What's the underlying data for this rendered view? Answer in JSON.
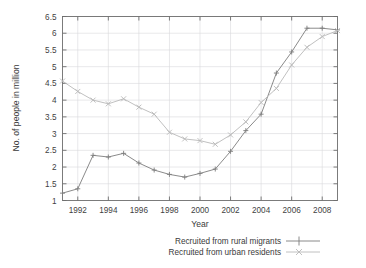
{
  "chart_data": {
    "type": "line",
    "title": "",
    "xlabel": "Year",
    "ylabel": "No. of people in million",
    "xlim": [
      1991,
      2009
    ],
    "ylim": [
      1,
      6.5
    ],
    "grid": true,
    "legend_position": "bottom",
    "x": [
      1991,
      1992,
      1993,
      1994,
      1995,
      1996,
      1997,
      1998,
      1999,
      2000,
      2001,
      2002,
      2003,
      2004,
      2005,
      2006,
      2007,
      2008,
      2009
    ],
    "xticks": [
      1992,
      1994,
      1996,
      1998,
      2000,
      2002,
      2004,
      2006,
      2008
    ],
    "xtick_labels": [
      "1992",
      "1994",
      "1996",
      "1998",
      "2000",
      "2002",
      "2004",
      "2006",
      "2008"
    ],
    "yticks": [
      1,
      1.5,
      2,
      2.5,
      3,
      3.5,
      4,
      4.5,
      5,
      5.5,
      6,
      6.5
    ],
    "ytick_labels": [
      "1",
      "1.5",
      "2",
      "2.5",
      "3",
      "3.5",
      "4",
      "4.5",
      "5",
      "5.5",
      "6",
      "6.5"
    ],
    "series": [
      {
        "name": "Recruited from rural migrants",
        "marker": "plus",
        "color": "#7d7d7d",
        "values": [
          1.22,
          1.35,
          2.35,
          2.3,
          2.41,
          2.12,
          1.91,
          1.78,
          1.7,
          1.81,
          1.94,
          2.47,
          3.09,
          3.58,
          4.81,
          5.44,
          6.15,
          6.15,
          6.1
        ]
      },
      {
        "name": "Recruited from urban residents",
        "marker": "cross",
        "color": "#b9b9b9",
        "values": [
          4.57,
          4.26,
          4.0,
          3.89,
          4.04,
          3.79,
          3.58,
          3.04,
          2.84,
          2.79,
          2.68,
          2.96,
          3.35,
          3.93,
          4.35,
          5.05,
          5.58,
          5.9,
          6.08
        ]
      }
    ]
  },
  "axis": {
    "ylabel": "No. of people in million",
    "xlabel": "Year"
  },
  "legend": {
    "entries": [
      {
        "label": "Recruited from rural migrants"
      },
      {
        "label": "Recruited from urban residents"
      }
    ]
  },
  "colors": {
    "series_rural": "#7d7d7d",
    "series_urban": "#b9b9b9",
    "frame": "#6e6e6e",
    "grid": "#d8d8dc",
    "text": "#3a3a3a",
    "background": "#ffffff"
  }
}
